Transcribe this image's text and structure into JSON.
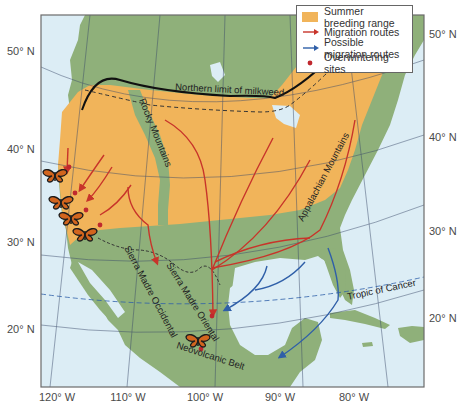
{
  "map": {
    "legend": {
      "items": [
        {
          "label": "Summer breeding range",
          "symbol": "orange-swatch",
          "color": "#f1b45a"
        },
        {
          "label": "Migration routes",
          "symbol": "red-arrow",
          "color": "#c8342a"
        },
        {
          "label": "Possible migration routes",
          "symbol": "blue-arrow",
          "color": "#2f5fa8"
        },
        {
          "label": "Overwintering sites",
          "symbol": "red-dot",
          "color": "#c0282e"
        }
      ]
    },
    "latitude_labels_left": [
      "50° N",
      "40° N",
      "30° N",
      "20° N"
    ],
    "latitude_labels_right": [
      "50° N",
      "40° N",
      "30° N",
      "20° N"
    ],
    "longitude_labels": [
      "120° W",
      "110° W",
      "100° W",
      "90° W",
      "80° W"
    ],
    "annotations": {
      "milkweed": "Northern limit of milkweed",
      "rocky": "Rocky Mountains",
      "appalachian": "Appalachian Mountains",
      "sierra_occidental": "Sierra Madre Occidental",
      "sierra_oriental": "Sierra Madre Oriental",
      "neovolcanic": "Neovolcanic Belt",
      "tropic": "Tropic of Cancer"
    },
    "colors": {
      "ocean": "#dcedf5",
      "land": "#8fb07a",
      "breeding_range": "#f1b45a",
      "migration": "#c8342a",
      "possible_migration": "#2f5fa8",
      "overwinter": "#c0282e",
      "frame": "#6b6b6b"
    },
    "overwintering_sites_count": 6
  }
}
